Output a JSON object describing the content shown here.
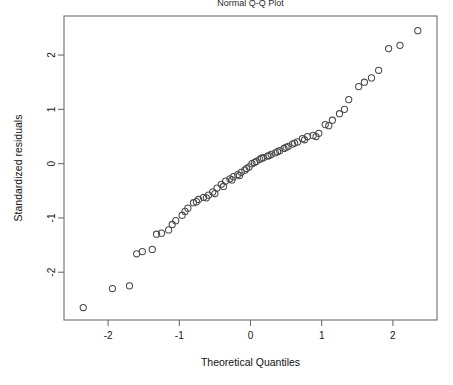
{
  "chart_data": {
    "type": "scatter",
    "title": "Normal Q-Q Plot",
    "xlabel": "Theoretical Quantiles",
    "ylabel": "Standardized residuals",
    "xlim": [
      -2.62,
      2.62
    ],
    "ylim": [
      -2.88,
      2.72
    ],
    "grid": false,
    "legend": null,
    "xticks": [
      -2,
      -1,
      0,
      1,
      2
    ],
    "xtick_labels": [
      "-2",
      "-1",
      "0",
      "1",
      "2"
    ],
    "yticks": [
      -2,
      -1,
      0,
      1,
      2
    ],
    "ytick_labels": [
      "-2",
      "-1",
      "0",
      "1",
      "2"
    ],
    "marker": "open-circle",
    "marker_color": "#4a4a4a",
    "n_points": 72,
    "x": [
      -2.35,
      -1.94,
      -1.7,
      -1.52,
      -1.38,
      -1.25,
      -1.15,
      -1.05,
      -0.96,
      -0.88,
      -0.8,
      -0.73,
      -0.66,
      -0.59,
      -0.53,
      -0.47,
      -0.41,
      -0.35,
      -0.29,
      -0.24,
      -0.18,
      -0.13,
      -0.08,
      -0.02,
      0.02,
      0.08,
      0.13,
      0.18,
      0.24,
      0.29,
      0.35,
      0.41,
      0.47,
      0.53,
      0.59,
      0.66,
      0.73,
      0.8,
      0.88,
      0.96,
      1.05,
      1.15,
      1.25,
      1.38,
      1.52,
      1.7,
      1.94,
      2.35,
      -1.6,
      -1.32,
      -1.1,
      -0.92,
      -0.76,
      -0.62,
      -0.5,
      -0.38,
      -0.26,
      -0.155,
      -0.055,
      0.055,
      0.155,
      0.26,
      0.38,
      0.5,
      0.62,
      0.76,
      0.92,
      1.1,
      1.32,
      1.6,
      2.1,
      1.8
    ],
    "y": [
      -2.65,
      -2.3,
      -2.25,
      -1.62,
      -1.58,
      -1.28,
      -1.22,
      -1.05,
      -0.95,
      -0.82,
      -0.72,
      -0.66,
      -0.62,
      -0.58,
      -0.52,
      -0.45,
      -0.38,
      -0.32,
      -0.28,
      -0.24,
      -0.2,
      -0.16,
      -0.12,
      -0.06,
      0.0,
      0.04,
      0.08,
      0.11,
      0.14,
      0.17,
      0.2,
      0.24,
      0.28,
      0.32,
      0.36,
      0.4,
      0.46,
      0.5,
      0.52,
      0.56,
      0.72,
      0.8,
      0.92,
      1.18,
      1.42,
      1.58,
      2.12,
      2.45,
      -1.66,
      -1.3,
      -1.12,
      -0.88,
      -0.7,
      -0.63,
      -0.55,
      -0.42,
      -0.3,
      -0.22,
      -0.09,
      0.02,
      0.1,
      0.15,
      0.22,
      0.3,
      0.38,
      0.44,
      0.5,
      0.7,
      1.0,
      1.5,
      2.18,
      1.72
    ]
  },
  "axes": {
    "x_title": "Theoretical Quantiles",
    "y_title": "Standardized residuals"
  },
  "title": {
    "text": "Normal Q-Q Plot"
  }
}
